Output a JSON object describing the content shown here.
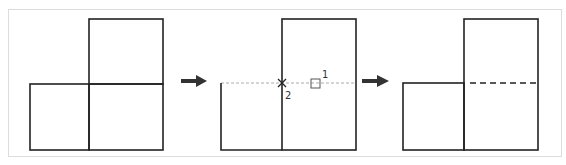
{
  "diagram": {
    "title": "",
    "frame_color": "#d9d9d9",
    "line_color": "#222222",
    "guide_color": "#aaaaaa",
    "steps": [
      {
        "name": "initial-shape",
        "description": "Two adjacent squares at bottom, tall square above right"
      },
      {
        "name": "trim-step",
        "description": "Lower-left square edge extended via tracking line",
        "markers": [
          {
            "id": "1",
            "label": "1",
            "type": "square-osnap"
          },
          {
            "id": "2",
            "label": "2",
            "type": "cross-point"
          }
        ]
      },
      {
        "name": "result-shape",
        "description": "Shared edge becomes hidden (dashed) line"
      }
    ],
    "arrows": [
      {
        "from": "initial-shape",
        "to": "trim-step"
      },
      {
        "from": "trim-step",
        "to": "result-shape"
      }
    ]
  }
}
